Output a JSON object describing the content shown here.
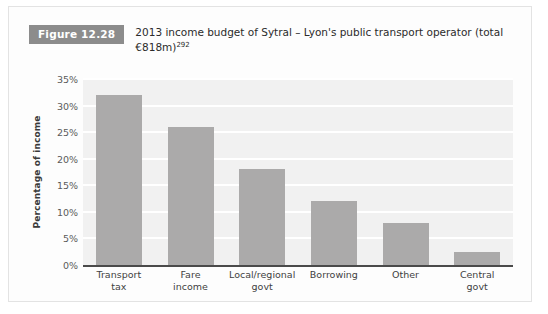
{
  "figure": {
    "badge_label": "Figure 12.28",
    "caption_main": "2013 income budget of Sytral – Lyon's public transport operator (total €818m)",
    "caption_superscript": "292"
  },
  "chart_data": {
    "type": "bar",
    "title": "2013 income budget of Sytral – Lyon's public transport operator (total €818m)",
    "xlabel": "",
    "ylabel": "Percentage of income",
    "categories": [
      "Transport tax",
      "Fare income",
      "Local/regional govt",
      "Borrowing",
      "Other",
      "Central govt"
    ],
    "category_lines": [
      [
        "Transport",
        "tax"
      ],
      [
        "Fare",
        "income"
      ],
      [
        "Local/regional",
        "govt"
      ],
      [
        "Borrowing"
      ],
      [
        "Other"
      ],
      [
        "Central",
        "govt"
      ]
    ],
    "values": [
      32,
      26,
      18,
      12,
      8,
      2.5
    ],
    "value_labels": [
      "32%",
      "26%",
      "18%",
      "12%",
      "8%",
      "2.5%"
    ],
    "ylim": [
      0,
      35
    ],
    "ytick_values": [
      35,
      30,
      25,
      20,
      15,
      10,
      5,
      0
    ],
    "ytick_labels": [
      "35%",
      "30%",
      "25%",
      "20%",
      "15%",
      "10%",
      "5%",
      "0%"
    ],
    "grid": true,
    "legend": "none",
    "bar_color": "#abaaaa",
    "plot_background": "#f1f1f1",
    "gridline_color": "#ffffff",
    "axis_color": "#4a4a4a",
    "badge_color": "#8c8c8c"
  }
}
